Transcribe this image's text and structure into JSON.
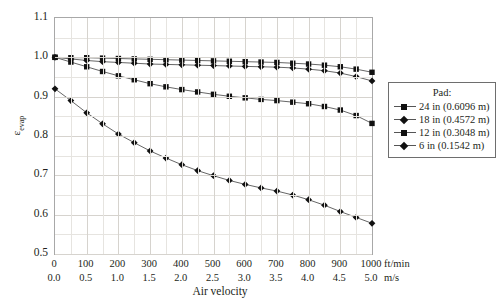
{
  "chart_data": {
    "type": "line",
    "title": "",
    "xlabel": "Air velocity",
    "ylabel": "ε",
    "ylabel_sub": "evap",
    "ylim": [
      0.5,
      1.1
    ],
    "ytick_step": 0.1,
    "yticks": [
      "1.1",
      "1.0",
      "0.9",
      "0.8",
      "0.7",
      "0.6",
      "0.5"
    ],
    "ytick_values": [
      1.1,
      1.0,
      0.9,
      0.8,
      0.7,
      0.6,
      0.5
    ],
    "xlim": [
      0,
      1000
    ],
    "xticks_ftmin": [
      "0",
      "100",
      "200",
      "300",
      "400",
      "500",
      "600",
      "700",
      "800",
      "900",
      "1000"
    ],
    "xtick_values": [
      0,
      100,
      200,
      300,
      400,
      500,
      600,
      700,
      800,
      900,
      1000
    ],
    "xticks_ms": [
      "0.0",
      "0.5",
      "1.0",
      "1.5",
      "2.0",
      "2.5",
      "3.0",
      "3.5",
      "4.0",
      "4.5",
      "5.0"
    ],
    "unit_primary": "ft/min",
    "unit_secondary": "m/s",
    "grid": true,
    "legend_position": "right-outside",
    "legend_title": "Pad:",
    "x": [
      0,
      50,
      100,
      150,
      200,
      250,
      300,
      350,
      400,
      450,
      500,
      550,
      600,
      650,
      700,
      750,
      800,
      850,
      900,
      950,
      1000
    ],
    "series": [
      {
        "name": "24 in (0.6096 m)",
        "marker": "square",
        "color": "#111111",
        "values": [
          1.0,
          0.999,
          0.999,
          0.998,
          0.997,
          0.996,
          0.995,
          0.994,
          0.993,
          0.992,
          0.991,
          0.99,
          0.989,
          0.988,
          0.987,
          0.985,
          0.983,
          0.98,
          0.976,
          0.97,
          0.962
        ]
      },
      {
        "name": "18 in (0.4572 m)",
        "marker": "diamond",
        "color": "#111111",
        "values": [
          1.0,
          0.996,
          0.992,
          0.989,
          0.987,
          0.985,
          0.983,
          0.982,
          0.981,
          0.98,
          0.979,
          0.978,
          0.977,
          0.976,
          0.975,
          0.973,
          0.97,
          0.966,
          0.96,
          0.951,
          0.94
        ]
      },
      {
        "name": "12 in (0.3048 m)",
        "marker": "square",
        "color": "#111111",
        "values": [
          1.0,
          0.988,
          0.976,
          0.964,
          0.953,
          0.943,
          0.933,
          0.925,
          0.918,
          0.912,
          0.906,
          0.901,
          0.897,
          0.893,
          0.89,
          0.886,
          0.882,
          0.875,
          0.866,
          0.852,
          0.832
        ]
      },
      {
        "name": "6 in (0.1542 m)",
        "marker": "diamond",
        "color": "#111111",
        "values": [
          0.92,
          0.89,
          0.859,
          0.831,
          0.805,
          0.783,
          0.762,
          0.744,
          0.727,
          0.712,
          0.699,
          0.687,
          0.677,
          0.668,
          0.66,
          0.65,
          0.638,
          0.624,
          0.608,
          0.593,
          0.578
        ]
      }
    ]
  }
}
